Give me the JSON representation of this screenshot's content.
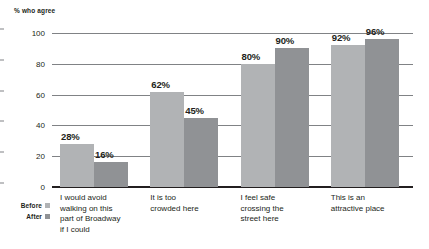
{
  "chart_data": {
    "type": "bar",
    "title": "% who agree",
    "xlabel": "",
    "ylabel": "% who agree",
    "ylim": [
      0,
      100
    ],
    "yticks": [
      0,
      20,
      40,
      60,
      80,
      100
    ],
    "grid": true,
    "legend_position": "bottom-left",
    "categories": [
      "I would avoid walking on this part of Broadway if I could",
      "It is too crowded here",
      "I feel safe crossing the street here",
      "This is an attractive place"
    ],
    "series": [
      {
        "name": "Before",
        "color": "#b1b3b5",
        "values": [
          28,
          62,
          80,
          92
        ]
      },
      {
        "name": "After",
        "color": "#909295",
        "values": [
          16,
          45,
          90,
          96
        ]
      }
    ],
    "value_labels": {
      "before": [
        "28%",
        "62%",
        "80%",
        "92%"
      ],
      "after": [
        "16%",
        "45%",
        "90%",
        "96%"
      ]
    },
    "category_lines": [
      [
        "I would avoid",
        "walking on this",
        "part of Broadway",
        "if I could"
      ],
      [
        "It is too",
        "crowded here"
      ],
      [
        "I feel safe",
        "crossing the",
        "street here"
      ],
      [
        "This is an",
        "attractive place"
      ]
    ],
    "ytick_labels": [
      "0",
      "20",
      "40",
      "60",
      "80",
      "100"
    ],
    "axis_color": "#808285",
    "baseline_color": "#231f20",
    "text_color": "#231f20"
  }
}
